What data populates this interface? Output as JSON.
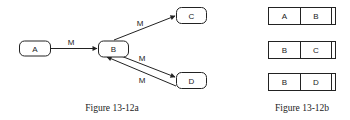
{
  "figure_a": {
    "caption": "Figure 13-12a",
    "nodes": {
      "a": {
        "label": "A"
      },
      "b": {
        "label": "B"
      },
      "c": {
        "label": "C"
      },
      "d": {
        "label": "D"
      }
    },
    "edges": {
      "a_b": {
        "from": "A",
        "to": "B",
        "label": "M"
      },
      "b_c": {
        "from": "B",
        "to": "C",
        "label": "M"
      },
      "b_d": {
        "from": "B",
        "to": "D",
        "label": "M"
      },
      "d_b": {
        "from": "D",
        "to": "B",
        "label": "M"
      }
    }
  },
  "figure_b": {
    "caption": "Figure 13-12b",
    "records": [
      {
        "first": "A",
        "second": "B"
      },
      {
        "first": "B",
        "second": "C"
      },
      {
        "first": "B",
        "second": "D"
      }
    ]
  },
  "colors": {
    "stroke": "#222222",
    "background": "#ffffff"
  }
}
